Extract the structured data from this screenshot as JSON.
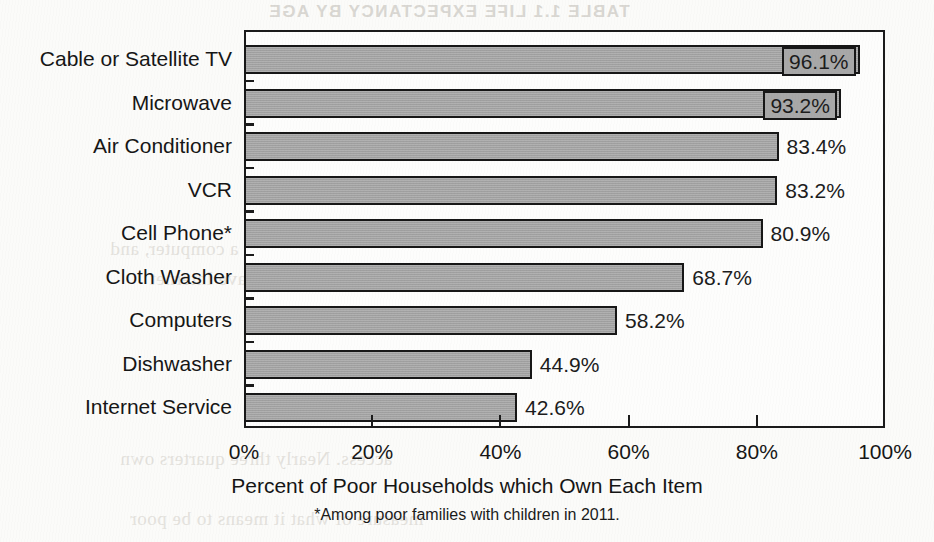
{
  "chart_data": {
    "type": "bar",
    "orientation": "horizontal",
    "title": "",
    "xlabel": "Percent of Poor Households which Own Each Item",
    "ylabel": "",
    "xlim": [
      0,
      100
    ],
    "xticks": [
      0,
      20,
      40,
      60,
      80,
      100
    ],
    "xtick_labels": [
      "0%",
      "20%",
      "40%",
      "60%",
      "80%",
      "100%"
    ],
    "grid": false,
    "legend": "none",
    "footnote": "*Among poor families with children in 2011.",
    "categories": [
      "Cable or Satellite TV",
      "Microwave",
      "Air Conditioner",
      "VCR",
      "Cell Phone*",
      "Cloth Washer",
      "Computers",
      "Dishwasher",
      "Internet Service"
    ],
    "values": [
      96.1,
      93.2,
      83.4,
      83.2,
      80.9,
      68.7,
      58.2,
      44.9,
      42.6
    ],
    "value_labels": [
      "96.1%",
      "93.2%",
      "83.4%",
      "83.2%",
      "80.9%",
      "68.7%",
      "58.2%",
      "44.9%",
      "42.6%"
    ],
    "label_placement": [
      "inside-boxed",
      "inside-boxed",
      "outside",
      "outside",
      "outside",
      "outside",
      "outside",
      "outside",
      "outside"
    ],
    "colors": {
      "bar_fill": "#a8a8a8",
      "bar_outline": "#171717",
      "axis": "#1b1b1b",
      "text": "#161616",
      "background": "#fbfbf9"
    }
  },
  "showthrough": {
    "title": "TABLE 1.1 LIFE EXPECTANCY BY AGE",
    "line1": "households have a computer, and",
    "line2": "more than half have Internet",
    "line3": "access. Nearly three quarters own",
    "line4": "measure of what it means to be poor"
  }
}
